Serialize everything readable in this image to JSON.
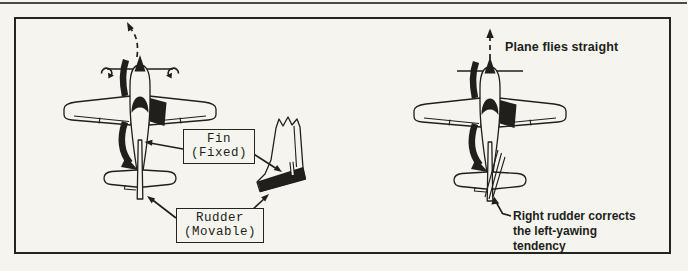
{
  "colors": {
    "paper": "#f6f4ee",
    "ink": "#211f1c"
  },
  "left_panel": {
    "fin_label": {
      "line1": "Fin",
      "line2": "(Fixed)"
    },
    "rudder_label": {
      "line1": "Rudder",
      "line2": "(Movable)"
    }
  },
  "right_panel": {
    "straight_label": "Plane flies straight",
    "correction_label": {
      "line1": "Right rudder corrects",
      "line2": "the left-yawing",
      "line3": "tendency"
    }
  }
}
